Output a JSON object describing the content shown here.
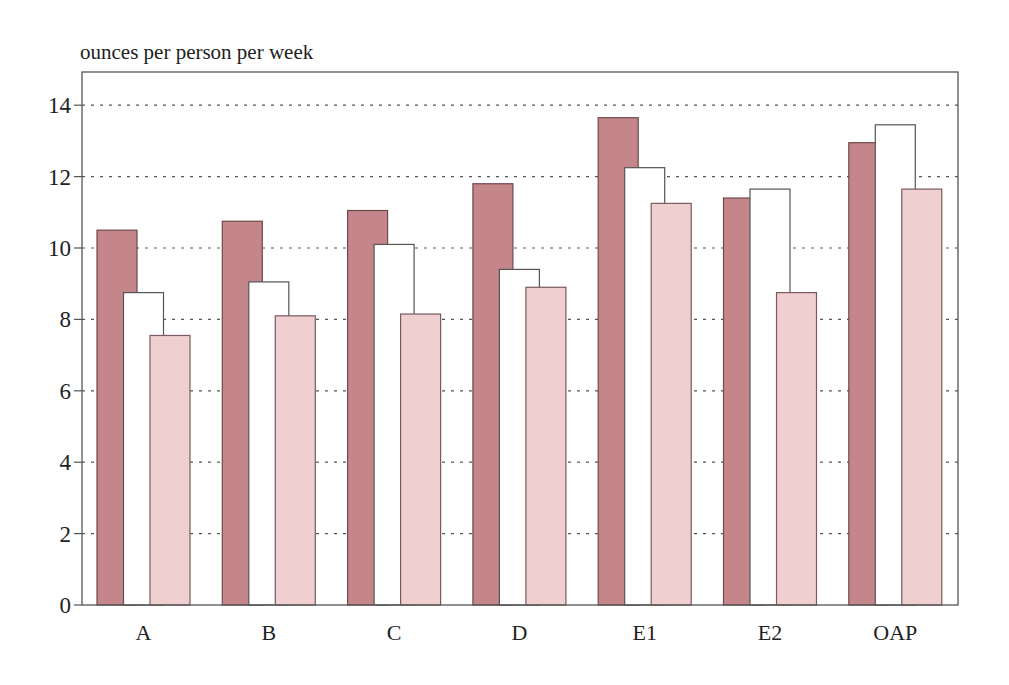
{
  "chart_data": {
    "type": "bar",
    "title": "",
    "ylabel": "ounces per person per week",
    "xlabel": "",
    "categories": [
      "A",
      "B",
      "C",
      "D",
      "E1",
      "E2",
      "OAP"
    ],
    "series": [
      {
        "name": "Series 1 (dark)",
        "color": "#c4868a",
        "values": [
          10.5,
          10.75,
          11.05,
          11.8,
          13.65,
          11.4,
          12.95
        ]
      },
      {
        "name": "Series 2 (white)",
        "color": "#ffffff",
        "values": [
          8.75,
          9.05,
          10.1,
          9.4,
          12.25,
          11.65,
          13.45
        ]
      },
      {
        "name": "Series 3 (light)",
        "color": "#efcfcf",
        "values": [
          7.55,
          8.1,
          8.15,
          8.9,
          11.25,
          8.75,
          11.65
        ]
      }
    ],
    "ylim": [
      0,
      14.9
    ],
    "yticks": [
      0,
      2,
      4,
      6,
      8,
      10,
      12,
      14
    ],
    "grid": {
      "y": true,
      "style": "dotted"
    },
    "legend": "none"
  }
}
